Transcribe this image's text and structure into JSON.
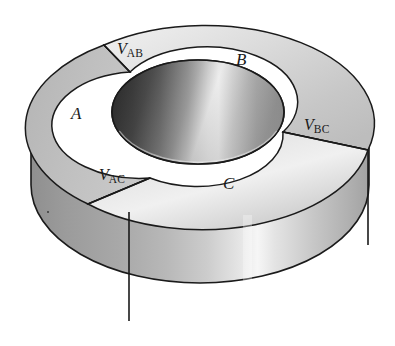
{
  "figure": {
    "background_color": "#ffffff",
    "outline_color": "#1a1a1a",
    "segment_labels": [
      {
        "id": "A",
        "text": "A",
        "x": 71,
        "y": 104
      },
      {
        "id": "B",
        "text": "B",
        "x": 236,
        "y": 50
      },
      {
        "id": "C",
        "text": "C",
        "x": 223,
        "y": 174
      }
    ],
    "voltage_labels": [
      {
        "id": "VAB",
        "symbol": "V",
        "subscript": "AB",
        "x": 117,
        "y": 40
      },
      {
        "id": "VBC",
        "symbol": "V",
        "subscript": "BC",
        "x": 304,
        "y": 116
      },
      {
        "id": "VAC",
        "symbol": "V",
        "subscript": "AC",
        "x": 99,
        "y": 166
      }
    ],
    "geometry": {
      "outer_ellipse": {
        "cx": 200,
        "cy": 128,
        "rx": 169,
        "ry": 98
      },
      "inner_ellipse": {
        "cx": 198,
        "cy": 112,
        "rx": 86,
        "ry": 52
      },
      "cylinder_height": 112,
      "shading": "grayscale gradient, bright highlight at front-center"
    },
    "colors": {
      "top_light": "#e8e8e8",
      "top_mid": "#bfbfbf",
      "top_dark": "#9a9a9a",
      "wall_light": "#f2f2f2",
      "wall_mid": "#c2c2c2",
      "wall_dark": "#8d8d8d",
      "hole_dark": "#1f1f1f",
      "hole_light": "#f4f4f4",
      "outline": "#1a1a1a"
    }
  }
}
